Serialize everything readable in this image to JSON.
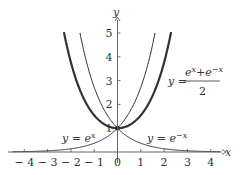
{
  "chart_data": {
    "type": "line",
    "title": "",
    "xlabel": "x",
    "ylabel": "y",
    "xlim": [
      -4.5,
      4.4
    ],
    "ylim": [
      0,
      5.6
    ],
    "grid": false,
    "x_ticks": [
      "-4",
      "-3",
      "-2",
      "-1",
      "0",
      "1",
      "2",
      "3",
      "4"
    ],
    "y_ticks": [
      "1",
      "2",
      "3",
      "4",
      "5"
    ],
    "series": [
      {
        "name": "y = e^x",
        "function": "exp(x)",
        "style": "thin",
        "domain": [
          -4.5,
          1.61
        ]
      },
      {
        "name": "y = e^{-x}",
        "function": "exp(-x)",
        "style": "thin",
        "domain": [
          -1.61,
          4.4
        ]
      },
      {
        "name": "y = (e^x + e^{-x})/2",
        "function": "cosh(x)",
        "style": "thick",
        "domain": [
          -2.3,
          2.3
        ]
      }
    ],
    "annotations": [
      {
        "text": "y = e^x",
        "x": -2.0,
        "y": 0.6
      },
      {
        "text": "y = e^{-x}",
        "x": 1.8,
        "y": 0.6
      },
      {
        "text": "y = (e^x + e^{-x})/2",
        "x": 3.0,
        "y": 3.0
      }
    ]
  },
  "labels": {
    "x_axis": "x",
    "y_axis": "y",
    "ex": "y = e",
    "ex_sup": "x",
    "emx": "y = e",
    "emx_sup": "−x",
    "cosh_y": "y =",
    "cosh_num_a": "e",
    "cosh_num_a_sup": "x",
    "cosh_plus": "+",
    "cosh_num_b": "e",
    "cosh_num_b_sup": "−x",
    "cosh_den": "2"
  },
  "colors": {
    "axis": "#555555",
    "curve": "#333333"
  }
}
